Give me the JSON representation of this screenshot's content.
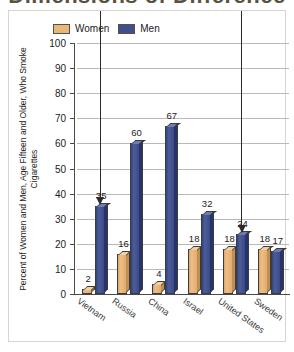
{
  "title": "Dimensions of Difference",
  "legend": {
    "position": "top-center",
    "entries": [
      {
        "label": "Women",
        "color": "#e8b878",
        "key": "women"
      },
      {
        "label": "Men",
        "color": "#3e4f8c",
        "key": "men"
      }
    ]
  },
  "chart_data": {
    "type": "bar",
    "title": "Dimensions of Difference",
    "xlabel": "",
    "ylabel": "Percent of Women and Men, Age Fifteen and Older, Who Smoke Cigarettes",
    "ylim": [
      0,
      100
    ],
    "ytick_step": 10,
    "yticks": [
      100,
      90,
      80,
      70,
      60,
      50,
      40,
      30,
      20,
      10,
      0
    ],
    "grid": true,
    "grid_axis": "y",
    "legend_position": "top-center",
    "categories": [
      "Vietnam",
      "Russia",
      "China",
      "Israel",
      "United States",
      "Sweden"
    ],
    "series": [
      {
        "name": "Women",
        "color": "#e8b878",
        "values": [
          2,
          16,
          4,
          18,
          18,
          18
        ]
      },
      {
        "name": "Men",
        "color": "#3e4f8c",
        "values": [
          35,
          60,
          67,
          32,
          24,
          17
        ]
      }
    ],
    "annotations": [
      {
        "type": "arrow",
        "points_to_category": "Vietnam",
        "points_to_series": "Men",
        "value": 35,
        "direction": "down"
      },
      {
        "type": "arrow",
        "points_to_category": "United States",
        "points_to_series": "Men",
        "value": 24,
        "direction": "down"
      }
    ]
  },
  "colors": {
    "women": "#e8b878",
    "men": "#3e4f8c",
    "grid": "#b9b9b9",
    "axis": "#4a4a4a",
    "frame": "#d8d5cc",
    "text": "#1c1c1c"
  }
}
